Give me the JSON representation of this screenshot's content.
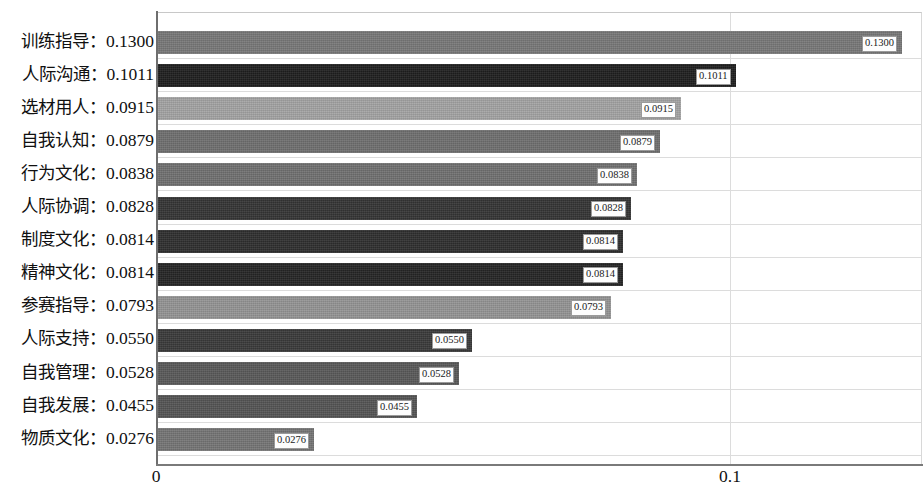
{
  "chart_data": {
    "type": "bar",
    "orientation": "horizontal",
    "title": "",
    "subtitle": "",
    "xlabel": "",
    "ylabel": "",
    "xlim": [
      0,
      0.1335
    ],
    "ylim": null,
    "grid": true,
    "legend": null,
    "xticks": [
      "0",
      "0.1"
    ],
    "xtick_values": [
      0,
      0.1
    ],
    "label_format": "0.0000",
    "categories": [
      "训练指导",
      "人际沟通",
      "选材用人",
      "自我认知",
      "行为文化",
      "人际协调",
      "制度文化",
      "精神文化",
      "参赛指导",
      "人际支持",
      "自我管理",
      "自我发展",
      "物质文化"
    ],
    "values": [
      0.13,
      0.1011,
      0.0915,
      0.0879,
      0.0838,
      0.0828,
      0.0814,
      0.0814,
      0.0793,
      0.055,
      0.0528,
      0.0455,
      0.0276
    ],
    "value_labels": [
      "0.1300",
      "0.1011",
      "0.0915",
      "0.0879",
      "0.0838",
      "0.0828",
      "0.0814",
      "0.0814",
      "0.0793",
      "0.0550",
      "0.0528",
      "0.0455",
      "0.0276"
    ],
    "axis_labels": [
      "训练指导：0.1300",
      "人际沟通：0.1011",
      "选材用人：0.0915",
      "自我认知：0.0879",
      "行为文化：0.0838",
      "人际协调：0.0828",
      "制度文化：0.0814",
      "精神文化：0.0814",
      "参赛指导：0.0793",
      "人际支持：0.0550",
      "自我管理：0.0528",
      "自我发展：0.0455",
      "物质文化：0.0276"
    ],
    "bar_colors": [
      "#787878",
      "#1f1f1f",
      "#a3a3a3",
      "#6f6f6f",
      "#707070",
      "#343434",
      "#2e2e2e",
      "#252525",
      "#949494",
      "#3a3a3a",
      "#595959",
      "#545454",
      "#757575"
    ],
    "value_label_box": {
      "fill": "#fdfdfd",
      "border": "#9a9a9a"
    },
    "axis_color": "#6e6e6e",
    "grid_color": "#dcdcdc",
    "background": "#ffffff"
  }
}
